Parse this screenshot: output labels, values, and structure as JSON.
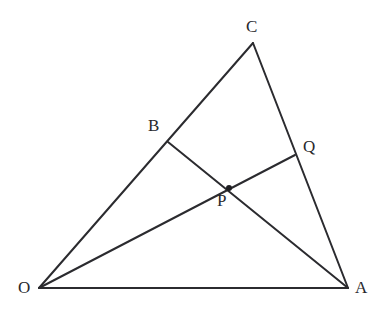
{
  "figure": {
    "kind": "geometry-diagram",
    "background_color": "#ffffff",
    "stroke_color": "#2b2b2f",
    "label_color": "#28282c",
    "canvas": {
      "width": 382,
      "height": 316
    },
    "points": [
      {
        "id": "O",
        "label": "O",
        "x": 39,
        "y": 288,
        "label_x": 18,
        "label_y": 279,
        "marker": false,
        "role": "triangle-vertex"
      },
      {
        "id": "A",
        "label": "A",
        "x": 348,
        "y": 288,
        "label_x": 355,
        "label_y": 279,
        "marker": false,
        "role": "triangle-vertex"
      },
      {
        "id": "C",
        "label": "C",
        "x": 253,
        "y": 43,
        "label_x": 246,
        "label_y": 18,
        "marker": false,
        "role": "triangle-vertex"
      },
      {
        "id": "B",
        "label": "B",
        "x": 168,
        "y": 142,
        "label_x": 148,
        "label_y": 117,
        "marker": false,
        "role": "point-on-side-OC"
      },
      {
        "id": "Q",
        "label": "Q",
        "x": 295,
        "y": 155,
        "label_x": 303,
        "label_y": 138,
        "marker": false,
        "role": "point-on-side-CA"
      },
      {
        "id": "P",
        "label": "P",
        "x": 229,
        "y": 188,
        "label_x": 217,
        "label_y": 192,
        "marker": true,
        "role": "cevian-intersection"
      }
    ],
    "segments": [
      {
        "id": "OA",
        "from": "O",
        "to": "A",
        "style": "base-line",
        "name": "segment-O-A"
      },
      {
        "id": "OC",
        "from": "O",
        "to": "C",
        "style": "edge-line",
        "name": "segment-O-C"
      },
      {
        "id": "CA",
        "from": "C",
        "to": "A",
        "style": "edge-line",
        "name": "segment-C-A"
      },
      {
        "id": "BA",
        "from": "B",
        "to": "A",
        "style": "cevian-line",
        "name": "segment-B-A"
      },
      {
        "id": "OQ",
        "from": "O",
        "to": "Q",
        "style": "cevian-line",
        "name": "segment-O-Q"
      }
    ]
  }
}
